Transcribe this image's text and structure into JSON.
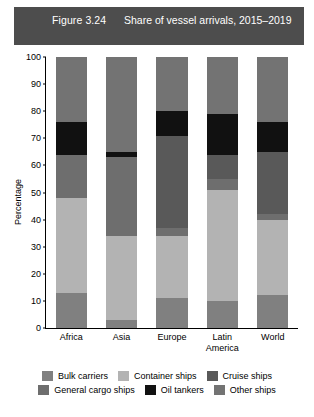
{
  "figure": {
    "number": "Figure 3.24",
    "title": "Share of vessel arrivals,\n2015–2019",
    "banner_color": "#4d4d4d"
  },
  "chart_data": {
    "type": "bar",
    "stacked": true,
    "title": "Share of vessel arrivals, 2015–2019",
    "xlabel": "",
    "ylabel": "Percentage",
    "ylim": [
      0,
      100
    ],
    "yticks": [
      0,
      10,
      20,
      30,
      40,
      50,
      60,
      70,
      80,
      90,
      100
    ],
    "grid": false,
    "legend_position": "bottom",
    "categories": [
      "Africa",
      "Asia",
      "Europe",
      "Latin\nAmerica",
      "World"
    ],
    "series": [
      {
        "name": "Bulk carriers",
        "color": "#808080",
        "values": [
          13,
          3,
          11,
          10,
          12
        ]
      },
      {
        "name": "Container ships",
        "color": "#b3b3b3",
        "values": [
          35,
          31,
          23,
          41,
          28
        ]
      },
      {
        "name": "General cargo ships",
        "color": "#6e6e6e",
        "values": [
          16,
          29,
          3,
          4,
          2
        ]
      },
      {
        "name": "Cruise ships",
        "color": "#595959",
        "values": [
          0,
          0,
          34,
          9,
          23
        ]
      },
      {
        "name": "Oil tankers",
        "color": "#111111",
        "values": [
          12,
          2,
          9,
          15,
          11
        ]
      },
      {
        "name": "Other ships",
        "color": "#737373",
        "values": [
          24,
          35,
          20,
          21,
          24
        ]
      }
    ]
  },
  "legend": {
    "rows": [
      [
        {
          "label": "Bulk carriers",
          "color": "#808080"
        },
        {
          "label": "Container ships",
          "color": "#b3b3b3"
        },
        {
          "label": "Cruise ships",
          "color": "#595959"
        }
      ],
      [
        {
          "label": "General cargo ships",
          "color": "#6e6e6e"
        },
        {
          "label": "Oil tankers",
          "color": "#111111"
        },
        {
          "label": "Other ships",
          "color": "#737373"
        }
      ]
    ]
  }
}
